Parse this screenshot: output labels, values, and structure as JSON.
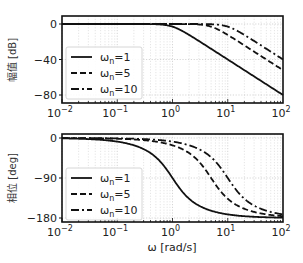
{
  "chart_data": [
    {
      "type": "line",
      "title": "",
      "xlabel": "",
      "ylabel": "幅值 [dB]",
      "xscale": "log",
      "xlim": [
        0.01,
        100
      ],
      "ylim": [
        -90,
        8
      ],
      "yticks": [
        0,
        -40,
        -80
      ],
      "ytick_labels": [
        "0",
        "−40",
        "−80"
      ],
      "xtick_labels": [
        "10^-2",
        "10^-1",
        "10^0",
        "10^1",
        "10^2"
      ],
      "grid": true,
      "legend_position": "lower left",
      "zeta": 0.707,
      "series": [
        {
          "name": "ωn=1",
          "wn": 1,
          "style": "solid",
          "x": [
            0.01,
            0.1,
            1,
            10,
            100
          ],
          "values": [
            0,
            0,
            -3,
            -40,
            -80
          ]
        },
        {
          "name": "ωn=5",
          "wn": 5,
          "style": "dashed",
          "x": [
            0.01,
            0.1,
            1,
            5,
            10,
            100
          ],
          "values": [
            0,
            0,
            0,
            -3,
            -12,
            -52
          ]
        },
        {
          "name": "ωn=10",
          "wn": 10,
          "style": "dashdot",
          "x": [
            0.01,
            0.1,
            1,
            10,
            100
          ],
          "values": [
            0,
            0,
            0,
            -3,
            -40
          ]
        }
      ]
    },
    {
      "type": "line",
      "title": "",
      "xlabel": "ω [rad/s]",
      "ylabel": "相位 [deg]",
      "xscale": "log",
      "xlim": [
        0.01,
        100
      ],
      "ylim": [
        -185,
        5
      ],
      "yticks": [
        0,
        -90,
        -180
      ],
      "ytick_labels": [
        "0",
        "−90",
        "−180"
      ],
      "xtick_labels": [
        "10^-2",
        "10^-1",
        "10^0",
        "10^1",
        "10^2"
      ],
      "grid": true,
      "legend_position": "lower left",
      "zeta": 0.707,
      "series": [
        {
          "name": "ωn=1",
          "wn": 1,
          "style": "solid",
          "x": [
            0.01,
            0.1,
            1,
            10,
            100
          ],
          "values": [
            -1,
            -8,
            -90,
            -172,
            -179
          ]
        },
        {
          "name": "ωn=5",
          "wn": 5,
          "style": "dashed",
          "x": [
            0.01,
            0.1,
            1,
            5,
            10,
            100
          ],
          "values": [
            0,
            -2,
            -16,
            -90,
            -137,
            -176
          ]
        },
        {
          "name": "ωn=10",
          "wn": 10,
          "style": "dashdot",
          "x": [
            0.01,
            0.1,
            1,
            10,
            100
          ],
          "values": [
            0,
            -1,
            -8,
            -90,
            -172
          ]
        }
      ]
    }
  ],
  "legend": {
    "items": [
      {
        "base": "ω",
        "sub": "n",
        "rest": "=1"
      },
      {
        "base": "ω",
        "sub": "n",
        "rest": "=5"
      },
      {
        "base": "ω",
        "sub": "n",
        "rest": "=10"
      }
    ]
  },
  "axes": {
    "top_ylabel": "幅值 [dB]",
    "bottom_ylabel": "相位 [deg]",
    "xlabel": "ω [rad/s]",
    "top_yticks": [
      "0",
      "−40",
      "−80"
    ],
    "bottom_yticks": [
      "0",
      "−90",
      "−180"
    ],
    "xticks": [
      {
        "base": "10",
        "exp": "−2"
      },
      {
        "base": "10",
        "exp": "−1"
      },
      {
        "base": "10",
        "exp": "0"
      },
      {
        "base": "10",
        "exp": "1"
      },
      {
        "base": "10",
        "exp": "2"
      }
    ]
  }
}
